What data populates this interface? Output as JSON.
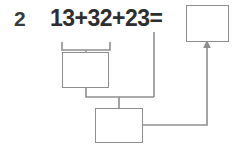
{
  "problem": {
    "number_label": "2",
    "equation_text": "13+32+23=",
    "operands": [
      13,
      32,
      23
    ],
    "operators": [
      "+",
      "+"
    ],
    "equals_sign": "=",
    "answer_boxes": [
      {
        "id": "total",
        "value": "",
        "placeholder": ""
      },
      {
        "id": "step1",
        "value": "",
        "placeholder": ""
      },
      {
        "id": "step2",
        "value": "",
        "placeholder": ""
      }
    ],
    "grouping_bracket": {
      "label": "bracket-under-13-plus-32",
      "covers": "13+32"
    },
    "arrow": {
      "label": "arrow-to-answer",
      "direction": "up",
      "target": "total"
    }
  },
  "colors": {
    "background": "#ffffff",
    "text": "#2e2e2e",
    "number_label": "#3a3a3a",
    "line": "#8e8e8e"
  }
}
